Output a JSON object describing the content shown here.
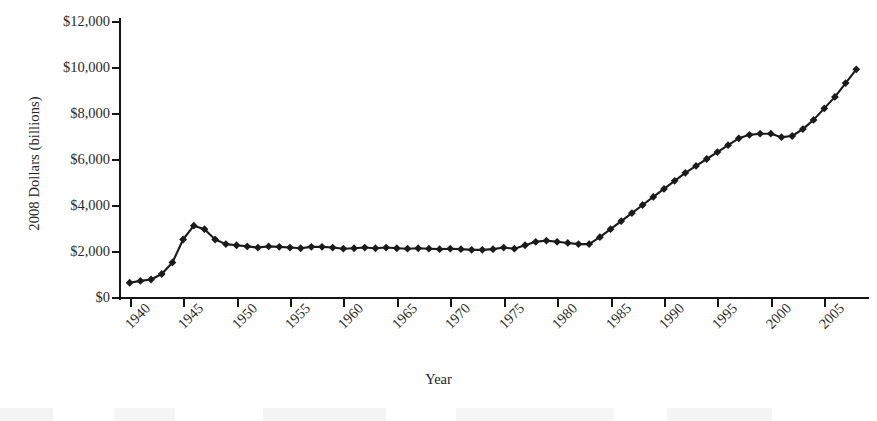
{
  "chart_data": {
    "type": "line",
    "title": "",
    "xlabel": "Year",
    "ylabel": "2008 Dollars (billions)",
    "xlim": [
      1939,
      2009
    ],
    "ylim": [
      0,
      12000
    ],
    "grid": false,
    "legend": null,
    "marker": "diamond",
    "line_color": "#1a1a1a",
    "marker_color": "#1a1a1a",
    "background_color": "#ffffff",
    "y_ticks": [
      0,
      2000,
      4000,
      6000,
      8000,
      10000,
      12000
    ],
    "y_tick_labels": [
      "$0",
      "$2,000",
      "$4,000",
      "$6,000",
      "$8,000",
      "$10,000",
      "$12,000"
    ],
    "x_ticks": [
      1940,
      1945,
      1950,
      1955,
      1960,
      1965,
      1970,
      1975,
      1980,
      1985,
      1990,
      1995,
      2000,
      2005
    ],
    "x_tick_labels": [
      "1940",
      "1945",
      "1950",
      "1955",
      "1960",
      "1965",
      "1970",
      "1975",
      "1980",
      "1985",
      "1990",
      "1995",
      "2000",
      "2005"
    ],
    "x": [
      1940,
      1941,
      1942,
      1943,
      1944,
      1945,
      1946,
      1947,
      1948,
      1949,
      1950,
      1951,
      1952,
      1953,
      1954,
      1955,
      1956,
      1957,
      1958,
      1959,
      1960,
      1961,
      1962,
      1963,
      1964,
      1965,
      1966,
      1967,
      1968,
      1969,
      1970,
      1971,
      1972,
      1973,
      1974,
      1975,
      1976,
      1977,
      1978,
      1979,
      1980,
      1981,
      1982,
      1983,
      1984,
      1985,
      1986,
      1987,
      1988,
      1989,
      1990,
      1991,
      1992,
      1993,
      1994,
      1995,
      1996,
      1997,
      1998,
      1999,
      2000,
      2001,
      2002,
      2003,
      2004,
      2005,
      2006,
      2007,
      2008
    ],
    "values": [
      620,
      700,
      760,
      1000,
      1500,
      2500,
      3100,
      2950,
      2500,
      2300,
      2250,
      2200,
      2150,
      2200,
      2180,
      2150,
      2120,
      2180,
      2180,
      2150,
      2100,
      2120,
      2150,
      2120,
      2150,
      2120,
      2100,
      2120,
      2100,
      2080,
      2100,
      2080,
      2050,
      2050,
      2080,
      2150,
      2100,
      2250,
      2400,
      2450,
      2400,
      2350,
      2300,
      2300,
      2600,
      2950,
      3300,
      3650,
      4000,
      4350,
      4700,
      5050,
      5400,
      5700,
      6000,
      6300,
      6600,
      6900,
      7050,
      7100,
      7100,
      6950,
      7000,
      7300,
      7700,
      8200,
      8700,
      9300,
      9900
    ],
    "series_name": "2008 Dollars (billions)"
  }
}
